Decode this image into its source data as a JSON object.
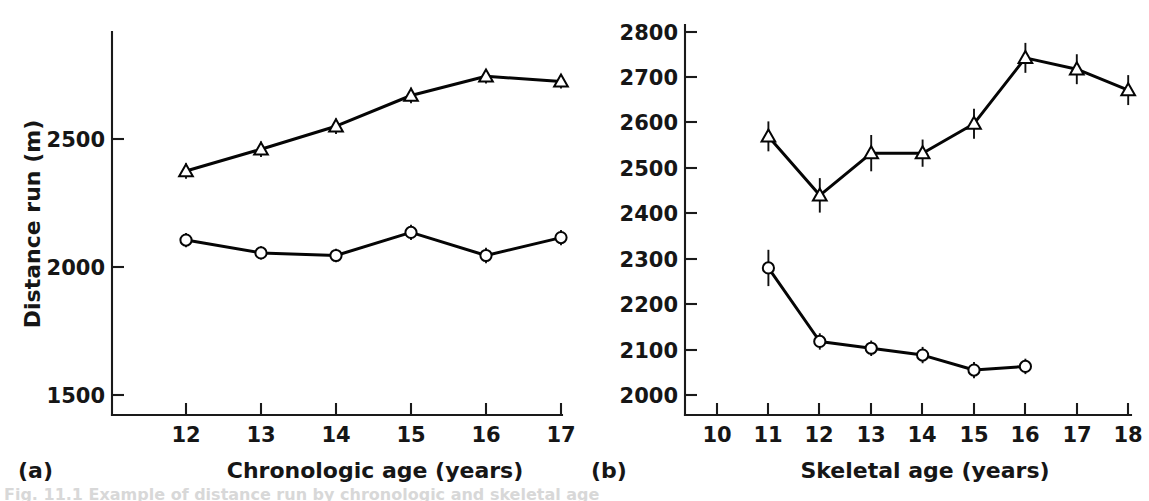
{
  "figure": {
    "caption_fragment": "Fig. 11.1  Example of distance run by chronologic and skeletal age"
  },
  "chart_data": [
    {
      "type": "line",
      "panel": "a",
      "panel_label": "(a)",
      "title": "",
      "xlabel": "Chronologic age (years)",
      "ylabel": "Distance run (m)",
      "xticks": [
        12,
        13,
        14,
        15,
        16,
        17
      ],
      "xticklabels": [
        "12",
        "13",
        "14",
        "15",
        "16",
        "17"
      ],
      "yticks": [
        1500,
        2000,
        2500
      ],
      "yticklabels": [
        "1500",
        "2000",
        "2500"
      ],
      "xlim": [
        11.3,
        17.35
      ],
      "ylim": [
        1390,
        2830
      ],
      "grid": false,
      "legend": "none",
      "errorbars": true,
      "series": [
        {
          "name": "triangle-series",
          "marker": "triangle",
          "x": [
            12,
            13,
            14,
            15,
            16,
            17
          ],
          "values": [
            2375,
            2460,
            2550,
            2670,
            2745,
            2725
          ],
          "errors": [
            30,
            30,
            30,
            30,
            28,
            28
          ]
        },
        {
          "name": "circle-series",
          "marker": "circle",
          "x": [
            12,
            13,
            14,
            15,
            16,
            17
          ],
          "values": [
            2105,
            2055,
            2045,
            2135,
            2045,
            2115
          ],
          "errors": [
            28,
            26,
            26,
            30,
            30,
            30
          ]
        }
      ]
    },
    {
      "type": "line",
      "panel": "b",
      "panel_label": "(b)",
      "title": "",
      "xlabel": "Skeletal age (years)",
      "ylabel": "",
      "xticks": [
        10,
        11,
        12,
        13,
        14,
        15,
        16,
        17,
        18
      ],
      "xticklabels": [
        "10",
        "11",
        "12",
        "13",
        "14",
        "15",
        "16",
        "17",
        "18"
      ],
      "yticks": [
        2000,
        2100,
        2200,
        2300,
        2400,
        2500,
        2600,
        2700,
        2800
      ],
      "yticklabels": [
        "2000",
        "2100",
        "2200",
        "2300",
        "2400",
        "2500",
        "2600",
        "2700",
        "2800"
      ],
      "xlim": [
        9.35,
        18.4
      ],
      "ylim": [
        1945,
        2835
      ],
      "grid": false,
      "legend": "none",
      "errorbars": true,
      "series": [
        {
          "name": "triangle-series",
          "marker": "triangle",
          "x": [
            11,
            12,
            13,
            14,
            15,
            16,
            17,
            18
          ],
          "values": [
            2570,
            2440,
            2533,
            2533,
            2598,
            2743,
            2718,
            2672
          ],
          "errors": [
            33,
            38,
            40,
            30,
            33,
            33,
            33,
            33
          ]
        },
        {
          "name": "circle-series",
          "marker": "circle",
          "x": [
            11,
            12,
            13,
            14,
            15,
            16
          ],
          "values": [
            2280,
            2118,
            2103,
            2088,
            2055,
            2063
          ],
          "errors": [
            40,
            18,
            17,
            18,
            18,
            17
          ]
        }
      ]
    }
  ]
}
